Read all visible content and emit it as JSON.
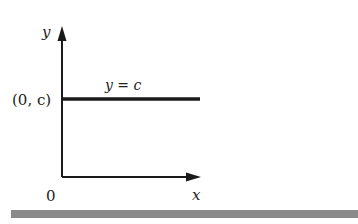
{
  "figure": {
    "axes": {
      "y_label": "y",
      "x_label": "x",
      "origin_label": "0"
    },
    "line": {
      "equation_label": "y = c",
      "intercept_label": "(0, c)",
      "description": "horizontal line"
    },
    "colors": {
      "ink": "#1a1a1a",
      "bar": "#8a8a8a"
    }
  }
}
